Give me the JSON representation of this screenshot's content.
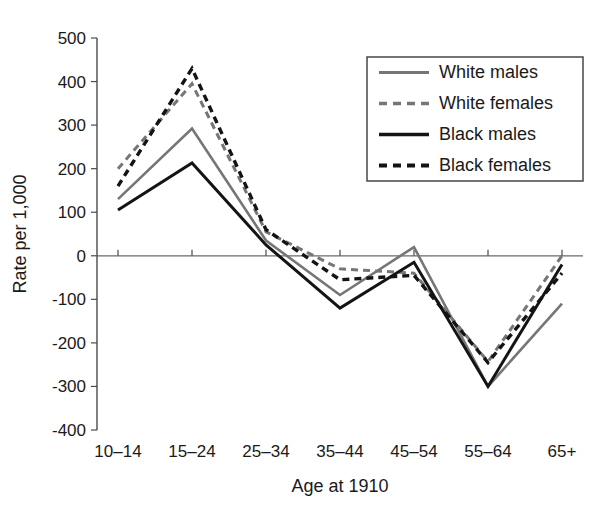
{
  "chart_data": {
    "type": "line",
    "title": "",
    "xlabel": "Age at 1910",
    "ylabel": "Rate per 1,000",
    "categories": [
      "10–14",
      "15–24",
      "25–34",
      "35–44",
      "45–54",
      "55–64",
      "65+"
    ],
    "ylim": [
      -400,
      500
    ],
    "ytick_values": [
      500,
      400,
      300,
      200,
      100,
      0,
      -100,
      -200,
      -300,
      -400
    ],
    "ytick_labels": [
      "500",
      "400",
      "300",
      "200",
      "100",
      "0",
      "-100",
      "-200",
      "-300",
      "-400"
    ],
    "grid": false,
    "legend_position": "top-right",
    "series": [
      {
        "name": "White males",
        "style": "solid",
        "color": "#767676",
        "width": 2.6,
        "values": [
          130,
          292,
          35,
          -90,
          20,
          -300,
          -110
        ]
      },
      {
        "name": "White females",
        "style": "dashed",
        "color": "#767676",
        "width": 3.0,
        "values": [
          200,
          395,
          55,
          -30,
          -40,
          -243,
          0
        ]
      },
      {
        "name": "Black males",
        "style": "solid",
        "color": "#141414",
        "width": 3.0,
        "values": [
          105,
          213,
          25,
          -120,
          -15,
          -300,
          -20
        ]
      },
      {
        "name": "Black females",
        "style": "dashed",
        "color": "#141414",
        "width": 3.4,
        "values": [
          160,
          430,
          60,
          -55,
          -45,
          -245,
          -40
        ]
      }
    ]
  },
  "axes": {
    "y_axis_title": "Rate per 1,000",
    "x_axis_title": "Age at 1910"
  },
  "legend": {
    "entries": [
      {
        "label": "White males"
      },
      {
        "label": "White females"
      },
      {
        "label": "Black males"
      },
      {
        "label": "Black females"
      }
    ]
  },
  "colors": {
    "white_series": "#767676",
    "black_series": "#141414",
    "axis": "#4a4a4a",
    "zero_line": "#6a6a6a",
    "background": "#ffffff"
  }
}
